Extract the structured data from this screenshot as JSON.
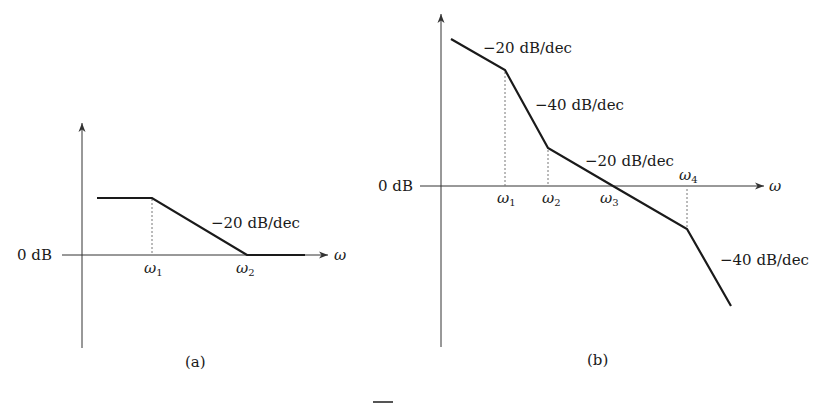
{
  "diagram_a": {
    "caption": "(a)",
    "y_axis_label": "0 dB",
    "x_axis_label": "ω",
    "corner_labels": [
      {
        "sym": "ω",
        "sub": "1"
      },
      {
        "sym": "ω",
        "sub": "2"
      }
    ],
    "slope_labels": [
      "−20 dB/dec"
    ]
  },
  "diagram_b": {
    "caption": "(b)",
    "y_axis_label": "0 dB",
    "x_axis_label": "ω",
    "corner_labels": [
      {
        "sym": "ω",
        "sub": "1"
      },
      {
        "sym": "ω",
        "sub": "2"
      },
      {
        "sym": "ω",
        "sub": "3"
      },
      {
        "sym": "ω",
        "sub": "4"
      }
    ],
    "slope_labels": [
      "−20 dB/dec",
      "−40 dB/dec",
      "−20 dB/dec",
      "−40 dB/dec"
    ]
  },
  "colors": {
    "line": "#1a1a1a",
    "axis": "#333333",
    "dashed": "#777777",
    "background": "#ffffff"
  }
}
